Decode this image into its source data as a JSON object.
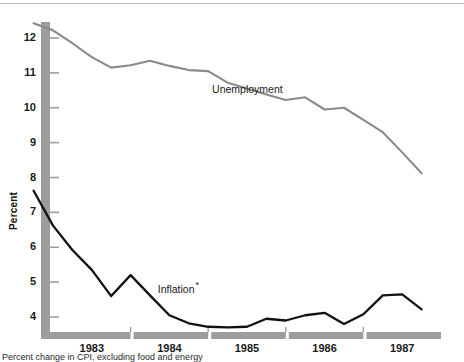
{
  "chart_data": {
    "type": "line",
    "title": "",
    "xlabel": "",
    "ylabel": "Percent",
    "ylim": [
      3.5,
      12.6
    ],
    "xlim": [
      1982.75,
      1987.75
    ],
    "yticks": [
      12,
      11,
      10,
      9,
      8,
      7,
      6,
      5,
      4
    ],
    "ytick_labels": [
      "12",
      "11",
      "10",
      "9",
      "8",
      "7",
      "6",
      "5",
      "4"
    ],
    "xtick_labels": [
      "1983",
      "1984",
      "1985",
      "1986",
      "1987"
    ],
    "grid": false,
    "legend_position": "inline-annotation",
    "x": [
      1982.75,
      1983.0,
      1983.25,
      1983.5,
      1983.75,
      1984.0,
      1984.25,
      1984.5,
      1984.75,
      1985.0,
      1985.25,
      1985.5,
      1985.75,
      1986.0,
      1986.25,
      1986.5,
      1986.75,
      1987.0,
      1987.25,
      1987.5,
      1987.75
    ],
    "series": [
      {
        "name": "Unemployment",
        "color": "#8a8a8a",
        "label_x": 1985.05,
        "label_y": 10.55,
        "values": [
          12.42,
          12.22,
          11.85,
          11.45,
          11.15,
          11.22,
          11.35,
          11.2,
          11.08,
          11.05,
          10.72,
          10.55,
          10.38,
          10.22,
          10.3,
          9.95,
          10.0,
          9.65,
          9.3,
          8.72,
          8.12
        ]
      },
      {
        "name": "Inflation",
        "color": "#111111",
        "label_x": 1984.35,
        "label_y": 4.88,
        "footnote_marker": "*",
        "values": [
          7.62,
          6.62,
          5.92,
          5.35,
          4.6,
          5.2,
          4.62,
          4.05,
          3.82,
          3.72,
          3.7,
          3.72,
          3.95,
          3.9,
          4.05,
          4.12,
          3.8,
          4.08,
          4.62,
          4.65,
          4.22
        ]
      }
    ],
    "axis_style": {
      "bar_color": "#9d9d9d",
      "bar_thickness": 9,
      "tick_color": "#9d9d9d",
      "year_segment_gap": true
    }
  },
  "labels": {
    "y_axis_title": "Percent",
    "unemployment": "Unemployment",
    "inflation": "Inflation",
    "inflation_footnote_marker": "*"
  },
  "footnote": {
    "text": "Percent change in CPI, excluding food and energy"
  },
  "colors": {
    "unemployment_line": "#8a8a8a",
    "inflation_line": "#111111",
    "axis_bar": "#9d9d9d",
    "text": "#1a1a1a",
    "background": "#ffffff",
    "top_rule": "#b9b9b9"
  }
}
